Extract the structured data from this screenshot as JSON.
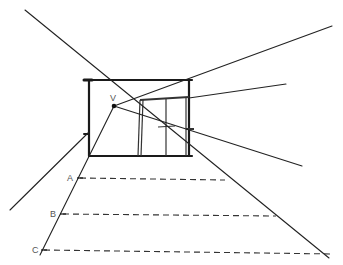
{
  "diagram": {
    "type": "one-point perspective sketch",
    "vanishing_point": {
      "label": "V",
      "x": 114,
      "y": 106
    },
    "stroke_color": "#1a1a1a",
    "dash_color": "#333333",
    "label_color": "#555555",
    "back_wall": {
      "x1": 89,
      "y1": 80,
      "x2": 192,
      "y2": 156
    },
    "door": {
      "x1": 140,
      "y1": 100,
      "x2": 189,
      "y2": 156
    },
    "markers": [
      {
        "label": "A",
        "x": 78,
        "y": 178,
        "line_end_x": 225
      },
      {
        "label": "B",
        "x": 61,
        "y": 214,
        "line_end_x": 276
      },
      {
        "label": "C",
        "x": 42,
        "y": 250,
        "line_end_x": 333
      }
    ]
  }
}
